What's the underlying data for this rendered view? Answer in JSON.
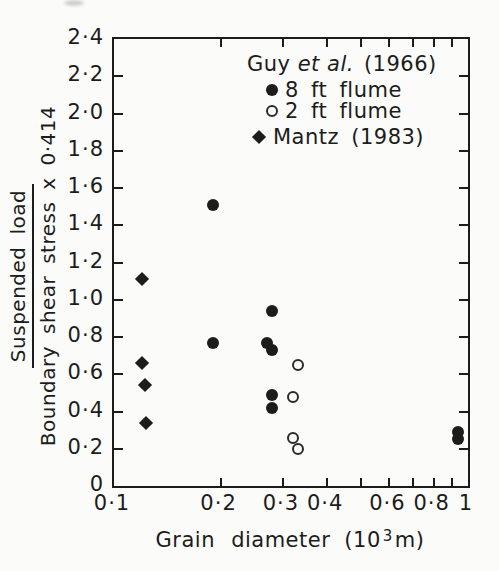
{
  "figure": {
    "background": "#fbfbf9",
    "ink": "#1c1c1c"
  },
  "y_axis": {
    "title_numerator": "Suspended load",
    "title_denominator": "Boundary shear stress x 0·414",
    "min": 0,
    "max": 2.4,
    "ticks": [
      {
        "value": 0,
        "label": "0"
      },
      {
        "value": 0.2,
        "label": "0·2"
      },
      {
        "value": 0.4,
        "label": "0·4"
      },
      {
        "value": 0.6,
        "label": "0·6"
      },
      {
        "value": 0.8,
        "label": "0·8"
      },
      {
        "value": 1.0,
        "label": "1·0"
      },
      {
        "value": 1.2,
        "label": "1·2"
      },
      {
        "value": 1.4,
        "label": "1·4"
      },
      {
        "value": 1.6,
        "label": "1·6"
      },
      {
        "value": 1.8,
        "label": "1·8"
      },
      {
        "value": 2.0,
        "label": "2·0"
      },
      {
        "value": 2.2,
        "label": "2·2"
      },
      {
        "value": 2.4,
        "label": "2·4"
      }
    ]
  },
  "x_axis": {
    "title": "Grain diameter",
    "unit_base": "(10",
    "unit_exp": "3",
    "unit_close": "m)",
    "scale": "log",
    "min": 0.1,
    "max": 1,
    "ticks": [
      {
        "value": 0.1,
        "label": "0·1",
        "tick": false
      },
      {
        "value": 0.2,
        "label": "0·2",
        "tick": true
      },
      {
        "value": 0.3,
        "label": "0·3",
        "tick": true
      },
      {
        "value": 0.4,
        "label": "0·4",
        "tick": true
      },
      {
        "value": 0.5,
        "label": null,
        "tick": true
      },
      {
        "value": 0.6,
        "label": "0·6",
        "tick": true
      },
      {
        "value": 0.7,
        "label": null,
        "tick": true
      },
      {
        "value": 0.8,
        "label": "0·8",
        "tick": true
      },
      {
        "value": 0.9,
        "label": null,
        "tick": true
      },
      {
        "value": 1,
        "label": "1",
        "tick": false
      }
    ]
  },
  "legend": {
    "group_title": {
      "pre": "Guy",
      "italic": "et al.",
      "year": "(1966)"
    },
    "items": [
      {
        "marker": "filled-circle",
        "label": "8 ft flume"
      },
      {
        "marker": "open-circle",
        "label": "2 ft flume"
      },
      {
        "marker": "filled-diamond",
        "label": "Mantz (1983)"
      }
    ]
  },
  "chart_data": {
    "type": "scatter",
    "title": "",
    "xlabel": "Grain diameter (10³ m)",
    "ylabel": "Suspended load / (Boundary shear stress x 0.414)",
    "x_scale": "log",
    "xlim": [
      0.1,
      1
    ],
    "ylim": [
      0,
      2.4
    ],
    "grid": false,
    "legend_position": "top-right-inside",
    "series": [
      {
        "name": "Guy et al. (1966) 8 ft flume",
        "marker": "filled-circle",
        "points": [
          [
            0.19,
            1.51
          ],
          [
            0.19,
            0.77
          ],
          [
            0.27,
            0.77
          ],
          [
            0.28,
            0.94
          ],
          [
            0.28,
            0.73
          ],
          [
            0.28,
            0.49
          ],
          [
            0.28,
            0.42
          ],
          [
            0.94,
            0.29
          ],
          [
            0.94,
            0.25
          ]
        ]
      },
      {
        "name": "Guy et al. (1966) 2 ft flume",
        "marker": "open-circle",
        "points": [
          [
            0.33,
            0.65
          ],
          [
            0.32,
            0.48
          ],
          [
            0.32,
            0.26
          ],
          [
            0.33,
            0.2
          ]
        ]
      },
      {
        "name": "Mantz (1983)",
        "marker": "filled-diamond",
        "points": [
          [
            0.12,
            1.11
          ],
          [
            0.12,
            0.66
          ],
          [
            0.122,
            0.54
          ],
          [
            0.123,
            0.34
          ]
        ]
      }
    ]
  }
}
